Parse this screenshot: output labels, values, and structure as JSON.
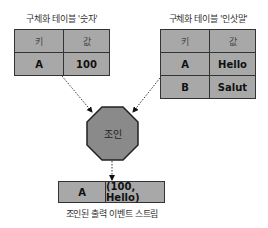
{
  "left_table": {
    "title": "구체화 테이블 '숫자'",
    "headers": [
      "키",
      "값"
    ],
    "rows": [
      [
        "A",
        "100"
      ]
    ]
  },
  "right_table": {
    "title": "구체화 테이블 '인삿말'",
    "headers": [
      "키",
      "값"
    ],
    "rows": [
      [
        "A",
        "Hello"
      ],
      [
        "B",
        "Salut"
      ]
    ]
  },
  "join_node": {
    "label": "조인",
    "shape": "octagon",
    "color": "#8a8a8a"
  },
  "output": {
    "key": "A",
    "value": "(100, Hello)",
    "caption": "조인된 출력 이벤트 스트림"
  },
  "colors": {
    "cell_fill": "#a8a8a8",
    "border": "#333333"
  }
}
